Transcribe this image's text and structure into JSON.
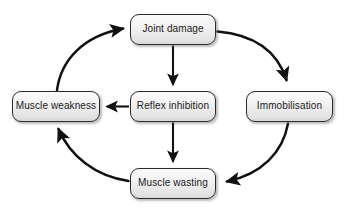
{
  "diagram": {
    "type": "cycle-flow-diagram",
    "background_color": "#ffffff",
    "node_fill_color": "#ededed",
    "node_border_color": "#2b2b2b",
    "edge_color": "#111111",
    "nodes": [
      {
        "id": "joint-damage",
        "label": "Joint damage"
      },
      {
        "id": "muscle-weakness",
        "label": "Muscle weakness"
      },
      {
        "id": "reflex-inhibition",
        "label": "Reflex inhibition"
      },
      {
        "id": "immobilisation",
        "label": "Immobilisation"
      },
      {
        "id": "muscle-wasting",
        "label": "Muscle wasting"
      }
    ],
    "edges": [
      {
        "id": "joint-damage-to-reflex-inhibition",
        "from": "joint-damage",
        "to": "reflex-inhibition",
        "style": "straight-vertical"
      },
      {
        "id": "reflex-inhibition-to-muscle-wasting",
        "from": "reflex-inhibition",
        "to": "muscle-wasting",
        "style": "straight-vertical"
      },
      {
        "id": "reflex-inhibition-to-muscle-weakness",
        "from": "reflex-inhibition",
        "to": "muscle-weakness",
        "style": "straight-horizontal"
      },
      {
        "id": "joint-damage-to-immobilisation",
        "from": "joint-damage",
        "to": "immobilisation",
        "style": "curved-arc"
      },
      {
        "id": "immobilisation-to-muscle-wasting",
        "from": "immobilisation",
        "to": "muscle-wasting",
        "style": "curved-arc"
      },
      {
        "id": "muscle-wasting-to-muscle-weakness",
        "from": "muscle-wasting",
        "to": "muscle-weakness",
        "style": "curved-arc"
      },
      {
        "id": "muscle-weakness-to-joint-damage",
        "from": "muscle-weakness",
        "to": "joint-damage",
        "style": "curved-arc"
      }
    ]
  }
}
